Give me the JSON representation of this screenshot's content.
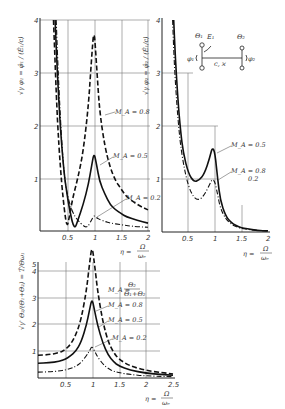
{
  "chart_data": [
    {
      "type": "line",
      "panel": "top-left",
      "ylabel": "√γ φ₁ = φ̂₁/(Ê₁/c)",
      "xlabel": "η = Ω/ωₑ",
      "xticks": [
        "0.5",
        "1",
        "1.5",
        "2"
      ],
      "yticks": [
        "1",
        "2",
        "3",
        "4"
      ],
      "xlim": [
        0,
        2
      ],
      "ylim": [
        0,
        4
      ],
      "grid": true,
      "series": [
        {
          "name": "M_A = 0.8",
          "style": "dashed",
          "x": [
            0.25,
            0.3,
            0.35,
            0.4,
            0.45,
            0.5,
            0.55,
            0.6,
            0.7,
            0.8,
            0.9,
            0.95,
            1.0,
            1.05,
            1.1,
            1.2,
            1.3,
            1.4,
            1.5,
            1.6,
            1.8,
            2.0
          ],
          "y": [
            4.0,
            2.6,
            1.6,
            0.9,
            0.4,
            0.05,
            0.3,
            0.6,
            1.0,
            1.5,
            2.4,
            3.2,
            3.9,
            3.1,
            2.3,
            1.6,
            1.2,
            0.95,
            0.8,
            0.65,
            0.5,
            0.4
          ]
        },
        {
          "name": "M_A = 0.5",
          "style": "solid",
          "x": [
            0.28,
            0.32,
            0.38,
            0.45,
            0.5,
            0.55,
            0.6,
            0.65,
            0.7,
            0.8,
            0.9,
            0.95,
            1.0,
            1.05,
            1.1,
            1.2,
            1.3,
            1.4,
            1.5,
            1.6,
            1.8,
            2.0
          ],
          "y": [
            4.0,
            3.0,
            1.9,
            1.05,
            0.7,
            0.4,
            0.15,
            0.05,
            0.2,
            0.5,
            0.9,
            1.2,
            1.5,
            1.25,
            0.95,
            0.7,
            0.5,
            0.4,
            0.33,
            0.27,
            0.2,
            0.15
          ]
        },
        {
          "name": "M_A = 0.2",
          "style": "dash-dot",
          "x": [
            0.3,
            0.35,
            0.4,
            0.45,
            0.5,
            0.6,
            0.7,
            0.8,
            0.85,
            0.9,
            0.95,
            1.0,
            1.05,
            1.1,
            1.2,
            1.3,
            1.5,
            1.7,
            2.0
          ],
          "y": [
            4.0,
            2.7,
            1.7,
            1.05,
            0.7,
            0.35,
            0.2,
            0.1,
            0.07,
            0.1,
            0.2,
            0.3,
            0.25,
            0.22,
            0.18,
            0.15,
            0.12,
            0.09,
            0.07
          ]
        }
      ],
      "annotations": [
        "M_A = 0.8",
        "M_A = 0.5",
        "M_A = 0.2"
      ]
    },
    {
      "type": "line",
      "panel": "top-right",
      "ylabel": "√γ φ₂ = φ̂₂/(Ê₁/c)",
      "xlabel": "η = Ω/ωₑ",
      "xticks": [
        "0.5",
        "1",
        "1.5",
        "2"
      ],
      "yticks": [
        "1",
        "2",
        "3",
        "4"
      ],
      "xlim": [
        0,
        2
      ],
      "ylim": [
        0,
        4
      ],
      "grid": true,
      "series": [
        {
          "name": "M_A = 0.5",
          "style": "solid",
          "x": [
            0.22,
            0.25,
            0.3,
            0.35,
            0.4,
            0.5,
            0.6,
            0.7,
            0.8,
            0.9,
            0.95,
            1.0,
            1.05,
            1.1,
            1.2,
            1.3,
            1.4,
            1.5,
            1.6,
            1.8,
            2.0
          ],
          "y": [
            4.0,
            3.3,
            2.5,
            1.9,
            1.5,
            1.1,
            0.95,
            0.97,
            1.1,
            1.4,
            1.6,
            1.5,
            1.0,
            0.6,
            0.3,
            0.18,
            0.12,
            0.08,
            0.06,
            0.03,
            0.02
          ]
        },
        {
          "name": "M_A = 0.8 / 0.2",
          "style": "dash-dot",
          "x": [
            0.2,
            0.23,
            0.28,
            0.33,
            0.4,
            0.5,
            0.6,
            0.7,
            0.8,
            0.9,
            0.95,
            1.0,
            1.05,
            1.1,
            1.2,
            1.3,
            1.4,
            1.5,
            1.6,
            1.8,
            2.0
          ],
          "y": [
            4.0,
            3.2,
            2.4,
            1.8,
            1.3,
            0.85,
            0.65,
            0.6,
            0.7,
            0.9,
            1.0,
            0.95,
            0.7,
            0.45,
            0.25,
            0.15,
            0.1,
            0.07,
            0.05,
            0.03,
            0.02
          ]
        }
      ],
      "annotations": [
        "M_A = 0.5",
        "M_A = 0.8",
        "0.2"
      ]
    },
    {
      "type": "line",
      "panel": "bottom",
      "ylabel": "√γ' Θ₂/(Θ₁+Θ₂) = T̂/Θω₁",
      "xlabel": "η = Ω/ωₑ",
      "xticks": [
        "0.5",
        "1",
        "1.5",
        "2",
        "2.5"
      ],
      "yticks": [
        "1",
        "2",
        "3",
        "4",
        "5"
      ],
      "xlim": [
        0,
        2.5
      ],
      "ylim": [
        0,
        5
      ],
      "grid": true,
      "series": [
        {
          "name": "M_A = 0.8",
          "style": "dashed",
          "x": [
            0.0,
            0.2,
            0.4,
            0.5,
            0.6,
            0.7,
            0.8,
            0.9,
            0.95,
            1.0,
            1.05,
            1.1,
            1.2,
            1.3,
            1.4,
            1.5,
            1.7,
            2.0,
            2.3,
            2.5
          ],
          "y": [
            0.85,
            0.87,
            0.95,
            1.05,
            1.25,
            1.6,
            2.2,
            3.3,
            4.2,
            5.0,
            4.2,
            3.3,
            2.1,
            1.35,
            0.95,
            0.7,
            0.45,
            0.28,
            0.2,
            0.15
          ]
        },
        {
          "name": "M_A = 0.5",
          "style": "solid",
          "x": [
            0.0,
            0.2,
            0.4,
            0.5,
            0.6,
            0.7,
            0.8,
            0.9,
            0.95,
            1.0,
            1.05,
            1.1,
            1.2,
            1.3,
            1.4,
            1.5,
            1.7,
            2.0,
            2.3,
            2.5
          ],
          "y": [
            0.55,
            0.57,
            0.62,
            0.7,
            0.82,
            1.0,
            1.35,
            2.0,
            2.5,
            3.0,
            2.5,
            2.0,
            1.3,
            0.85,
            0.6,
            0.45,
            0.3,
            0.18,
            0.13,
            0.1
          ]
        },
        {
          "name": "M_A = 0.2",
          "style": "dash-dot",
          "x": [
            0.0,
            0.2,
            0.4,
            0.5,
            0.6,
            0.7,
            0.8,
            0.9,
            0.95,
            1.0,
            1.05,
            1.1,
            1.2,
            1.3,
            1.4,
            1.5,
            1.7,
            2.0,
            2.3,
            2.5
          ],
          "y": [
            0.22,
            0.23,
            0.26,
            0.3,
            0.35,
            0.43,
            0.58,
            0.85,
            1.0,
            1.2,
            1.0,
            0.8,
            0.52,
            0.35,
            0.25,
            0.2,
            0.13,
            0.08,
            0.06,
            0.05
          ]
        }
      ],
      "annotations": [
        "M_A = Θ₂/(Θ₁+Θ₂)",
        "M_A = 0.8",
        "M_A = 0.5",
        "M_A = 0.2"
      ]
    }
  ],
  "labels": {
    "tl_ylabel": "√γ φ₁ = φ̂₁ / (Ê₁/c)",
    "tr_ylabel": "√γ φ₂ = φ̂₂ / (Ê₁/c)",
    "b_ylabel": "√γ' Θ₂/(Θ₁+Θ₂) = T̂/Θω₁",
    "eta": "η =",
    "omega_num": "Ω",
    "omega_den": "ωₑ",
    "tl_m08": "M_A = 0.8",
    "tl_m05": "M_A = 0.5",
    "tl_m02": "M_A = 0.2",
    "tr_m05": "M_A = 0.5",
    "tr_m08": "M_A = 0.8",
    "tr_m02": "0.2",
    "b_ma_def": "M_A =",
    "b_ma_num": "Θ₂",
    "b_ma_den": "Θ₁+Θ₂",
    "b_m08": "M_A = 0.8",
    "b_m05": "M_A = 0.5",
    "b_m02": "M_A = 0.2"
  },
  "diagram": {
    "theta1": "Θ₁",
    "e1": "E₁",
    "theta2": "Θ₂",
    "phi1": "φ₁",
    "phi2": "φ₂",
    "spring": "c, ϰ"
  }
}
